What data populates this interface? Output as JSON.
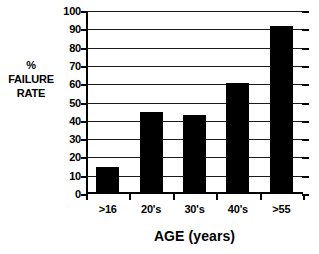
{
  "chart_data": {
    "type": "bar",
    "title": "",
    "subtitle": "",
    "xlabel": "AGE (years)",
    "ylabel": "% FAILURE RATE",
    "ylabel_lines": [
      "%",
      "FAILURE",
      "RATE"
    ],
    "categories": [
      ">16",
      "20's",
      "30's",
      "40's",
      ">55"
    ],
    "values": [
      14.5,
      45,
      43,
      60.5,
      92
    ],
    "ylim": [
      0,
      100
    ],
    "ytick_labels": [
      "0",
      "10",
      "20",
      "30",
      "40",
      "50",
      "60",
      "70",
      "80",
      "90",
      "100"
    ],
    "ytick_values": [
      0,
      10,
      20,
      30,
      40,
      50,
      60,
      70,
      80,
      90,
      100
    ],
    "grid": true,
    "grid_axis": "y",
    "legend": false,
    "legend_position": "none",
    "bar_color": "#000000",
    "axis_color": "#000000",
    "grid_color": "#1a1a1a",
    "background_color": "#ffffff",
    "annotations": []
  }
}
